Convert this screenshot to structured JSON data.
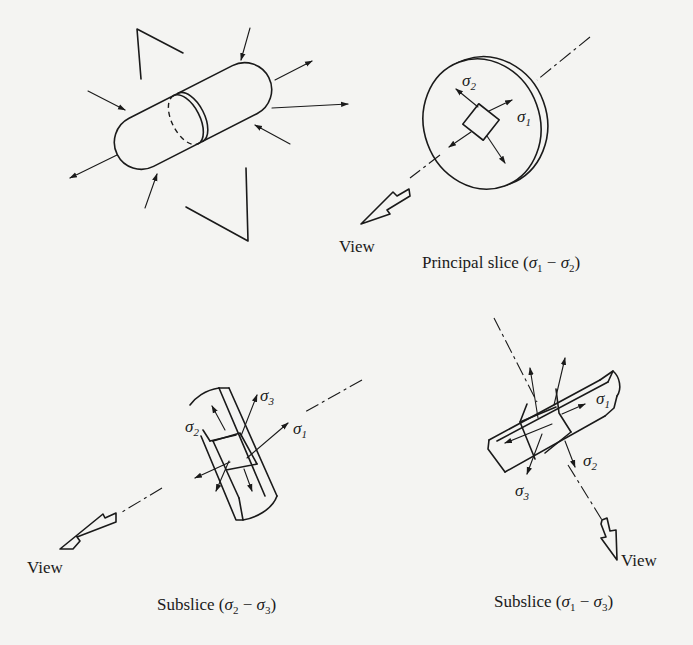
{
  "figure": {
    "panels": [
      {
        "id": "specimen",
        "description": "Cylindrical specimen under triaxial stress with section-view cutting marks"
      },
      {
        "id": "principal-slice",
        "caption": "Principal slice (σ₁ − σ₂)",
        "caption_main": "Principal slice (",
        "caption_end": ")",
        "view_label": "View",
        "labels": {
          "s1": "σ",
          "s1_sub": "1",
          "s2": "σ",
          "s2_sub": "2"
        }
      },
      {
        "id": "subslice-23",
        "caption": "Subslice (σ₂ − σ₃)",
        "caption_main": "Subslice (",
        "caption_end": ")",
        "view_label": "View",
        "labels": {
          "s1": "σ",
          "s1_sub": "1",
          "s2": "σ",
          "s2_sub": "2",
          "s3": "σ",
          "s3_sub": "3"
        }
      },
      {
        "id": "subslice-13",
        "caption": "Subslice (σ₁ − σ₃)",
        "caption_main": "Subslice (",
        "caption_end": ")",
        "view_label": "View",
        "labels": {
          "s1": "σ",
          "s1_sub": "1",
          "s2": "σ",
          "s2_sub": "2",
          "s3": "σ",
          "s3_sub": "3"
        }
      }
    ],
    "caption_symbols": {
      "sigma": "σ",
      "minus": "−",
      "sub1": "1",
      "sub2": "2",
      "sub3": "3"
    },
    "colors": {
      "ink": "#1a1a1a",
      "paper": "#f4f4f2"
    }
  }
}
